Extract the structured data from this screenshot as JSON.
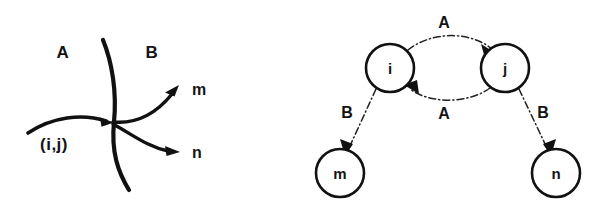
{
  "figure": {
    "title": "",
    "background_color": "#ffffff",
    "ink_color": "#111111",
    "left_panel": {
      "name": "boundary-crossing-diagram",
      "region_label_left": "A",
      "region_label_right": "B",
      "incoming_edge_label": "(i,j)",
      "outgoing_label_upper": "m",
      "outgoing_label_lower": "n"
    },
    "right_panel": {
      "name": "directed-graph-diagram",
      "nodes": [
        {
          "id": "i",
          "label": "i",
          "cx": 390,
          "cy": 68,
          "r": 24
        },
        {
          "id": "j",
          "label": "j",
          "cx": 505,
          "cy": 68,
          "r": 24
        },
        {
          "id": "m",
          "label": "m",
          "cx": 340,
          "cy": 173,
          "r": 24
        },
        {
          "id": "n",
          "label": "n",
          "cx": 556,
          "cy": 173,
          "r": 24
        }
      ],
      "edges": [
        {
          "from": "i",
          "to": "j",
          "label": "A",
          "style": "dash-dot",
          "curve": "arc-up"
        },
        {
          "from": "j",
          "to": "i",
          "label": "A",
          "style": "dash-dot",
          "curve": "arc-down"
        },
        {
          "from": "i",
          "to": "m",
          "label": "B",
          "style": "dash-dot",
          "curve": "straight"
        },
        {
          "from": "j",
          "to": "n",
          "label": "B",
          "style": "dash-dot",
          "curve": "straight"
        }
      ],
      "edge_label_top": "A",
      "edge_label_bottom": "A",
      "edge_label_left": "B",
      "edge_label_right": "B"
    }
  }
}
